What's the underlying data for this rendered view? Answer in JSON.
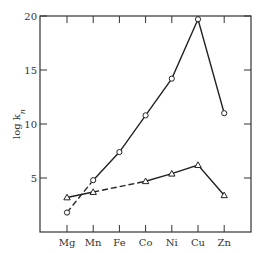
{
  "chart_data": {
    "type": "line",
    "title": "",
    "xlabel": "",
    "ylabel": "log k_n",
    "ylabel_main": "log k",
    "ylabel_sub": "n",
    "categories": [
      "Mg",
      "Mn",
      "Fe",
      "Co",
      "Ni",
      "Cu",
      "Zn"
    ],
    "ylim": [
      0,
      20
    ],
    "yticks": [
      5,
      10,
      15,
      20
    ],
    "grid": false,
    "legend": null,
    "series": [
      {
        "name": "circles",
        "marker": "circle",
        "values": [
          1.8,
          4.8,
          7.4,
          10.8,
          14.2,
          19.7,
          11.0
        ],
        "segments": [
          {
            "from": 0,
            "to": 1,
            "style": "dashed"
          },
          {
            "from": 1,
            "to": 6,
            "style": "solid"
          }
        ]
      },
      {
        "name": "triangles",
        "marker": "triangle",
        "values": [
          3.2,
          3.7,
          null,
          4.7,
          5.4,
          6.2,
          3.4
        ],
        "segments": [
          {
            "from": 0,
            "to": 1,
            "style": "solid"
          },
          {
            "from": 1,
            "to": 3,
            "style": "dashed"
          },
          {
            "from": 3,
            "to": 6,
            "style": "solid"
          }
        ]
      }
    ]
  }
}
